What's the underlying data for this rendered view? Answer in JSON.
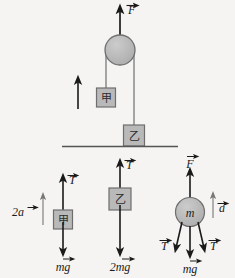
{
  "figure": {
    "background_color": "#f5f4f2",
    "stroke_color": "#1a1a1a",
    "block_fill": "#b9b9b9",
    "block_stroke": "#6e6e6e",
    "pulley_fill": "#b5b5b5",
    "rope_color": "#8a8a8a"
  },
  "main_diagram": {
    "name": "pulley-apparatus",
    "applied_force_label": "F",
    "pulley": {
      "name": "pulley",
      "cx": 120,
      "cy": 50,
      "r": 15
    },
    "block_left": {
      "label": "甲",
      "x": 82,
      "y": 87,
      "w": 19,
      "h": 19
    },
    "block_right": {
      "label": "乙",
      "x": 110,
      "y": 124,
      "w": 21,
      "h": 21
    },
    "motion_arrow": {
      "name": "block-jia-motion-arrow",
      "direction": "up"
    },
    "ground_line": {
      "x1": 62,
      "x2": 178,
      "y": 146
    }
  },
  "fbd_jia": {
    "name": "free-body-diagram-jia",
    "body_label": "甲",
    "up_force": "T",
    "down_force": "mg",
    "accel_label": "2a",
    "accel_direction": "up"
  },
  "fbd_yi": {
    "name": "free-body-diagram-yi",
    "body_label": "乙",
    "up_force": "T",
    "down_force": "2mg"
  },
  "fbd_pulley": {
    "name": "free-body-diagram-pulley",
    "body_label": "m",
    "up_force": "F",
    "down_force_left": "T",
    "down_force_right": "T",
    "down_force_center": "mg",
    "accel_label": "a",
    "accel_direction": "up"
  }
}
